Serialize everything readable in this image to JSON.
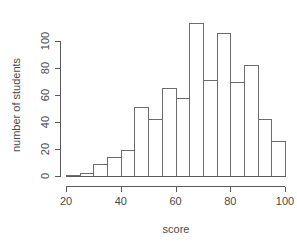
{
  "chart_data": {
    "type": "bar",
    "title": "",
    "subtitle": "",
    "xlabel": "score",
    "ylabel": "number of students",
    "bin_width": 5,
    "bin_starts": [
      20,
      25,
      30,
      35,
      40,
      45,
      50,
      55,
      60,
      65,
      70,
      75,
      80,
      85,
      90,
      95
    ],
    "categories": [
      "20-25",
      "25-30",
      "30-35",
      "35-40",
      "40-45",
      "45-50",
      "50-55",
      "55-60",
      "60-65",
      "65-70",
      "70-75",
      "75-80",
      "80-85",
      "85-90",
      "90-95",
      "95-100"
    ],
    "values": [
      1,
      2,
      9,
      14,
      19,
      51,
      42,
      65,
      58,
      113,
      71,
      106,
      70,
      82,
      42,
      26
    ],
    "xlim": [
      20,
      100
    ],
    "ylim": [
      0,
      115
    ],
    "x_ticks": [
      20,
      40,
      60,
      80,
      100
    ],
    "y_ticks": [
      0,
      20,
      40,
      60,
      80,
      100
    ],
    "x_tick_labels": [
      "20",
      "40",
      "60",
      "80",
      "100"
    ],
    "y_tick_labels": [
      "0",
      "20",
      "40",
      "60",
      "80",
      "100"
    ],
    "grid": false,
    "legend": null,
    "legend_position": "none",
    "bar_fill_color": "#ffffff",
    "bar_stroke_color": "#6b6b6b",
    "axis_color": "#5a5a5a",
    "text_color": "#4a4a4a",
    "background_color": "#ffffff"
  },
  "axes": {
    "x_title": "score",
    "y_title": "number of students"
  }
}
